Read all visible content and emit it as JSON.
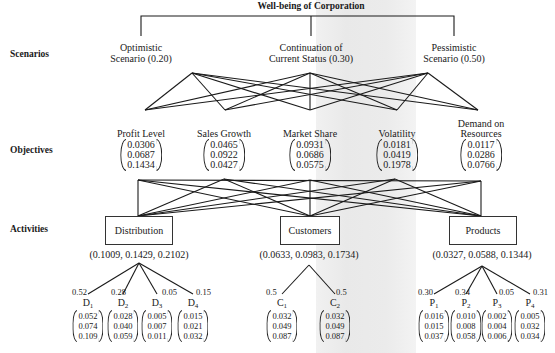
{
  "title": "Well-being of Corporation",
  "row_labels": {
    "scenarios": "Scenarios",
    "objectives": "Objectives",
    "activities": "Activities"
  },
  "scenarios": [
    {
      "line1": "Optimistic",
      "line2": "Scenario (0.20)"
    },
    {
      "line1": "Continuation of",
      "line2": "Current Status (0.30)"
    },
    {
      "line1": "Pessimistic",
      "line2": "Scenario (0.50)"
    }
  ],
  "objectives": [
    {
      "line1": "",
      "line2": "Profit Level",
      "values": [
        "0.0306",
        "0.0687",
        "0.1434"
      ]
    },
    {
      "line1": "",
      "line2": "Sales Growth",
      "values": [
        "0.0465",
        "0.0922",
        "0.0427"
      ]
    },
    {
      "line1": "",
      "line2": "Market Share",
      "values": [
        "0.0931",
        "0.0686",
        "0.0575"
      ]
    },
    {
      "line1": "",
      "line2": "Volatility",
      "values": [
        "0.0181",
        "0.0419",
        "0.1978"
      ]
    },
    {
      "line1": "Demand on",
      "line2": "Resources",
      "values": [
        "0.0117",
        "0.0286",
        "0.0766"
      ]
    }
  ],
  "activities": [
    {
      "label": "Distribution",
      "vector": "(0.1009, 0.1429, 0.2102)"
    },
    {
      "label": "Customers",
      "vector": "(0.0633, 0.0983, 0.1734)"
    },
    {
      "label": "Products",
      "vector": "(0.0327, 0.0588, 0.1344)"
    }
  ],
  "sub_activities": {
    "distribution": [
      {
        "letter": "D",
        "index": "1",
        "weight": "0.52",
        "values": [
          "0.052",
          "0.074",
          "0.109"
        ]
      },
      {
        "letter": "D",
        "index": "2",
        "weight": "0.28",
        "values": [
          "0.028",
          "0.040",
          "0.059"
        ]
      },
      {
        "letter": "D",
        "index": "3",
        "weight": "0.05",
        "values": [
          "0.005",
          "0.007",
          "0.011"
        ]
      },
      {
        "letter": "D",
        "index": "4",
        "weight": "0.15",
        "values": [
          "0.015",
          "0.021",
          "0.032"
        ]
      }
    ],
    "customers": [
      {
        "letter": "C",
        "index": "1",
        "weight": "0.5",
        "values": [
          "0.032",
          "0.049",
          "0.087"
        ]
      },
      {
        "letter": "C",
        "index": "2",
        "weight": "0.5",
        "values": [
          "0.032",
          "0.049",
          "0.087"
        ]
      }
    ],
    "products": [
      {
        "letter": "P",
        "index": "1",
        "weight": "0.30",
        "values": [
          "0.016",
          "0.015",
          "0.037"
        ]
      },
      {
        "letter": "P",
        "index": "2",
        "weight": "0.34",
        "values": [
          "0.010",
          "0.008",
          "0.058"
        ]
      },
      {
        "letter": "P",
        "index": "3",
        "weight": "0.05",
        "values": [
          "0.002",
          "0.004",
          "0.006"
        ]
      },
      {
        "letter": "P",
        "index": "4",
        "weight": "0.31",
        "values": [
          "0.005",
          "0.032",
          "0.034"
        ]
      }
    ]
  },
  "colors": {
    "ink": "#1a1a1a",
    "paper": "#ffffff",
    "bleed_through": "#ebebeb"
  }
}
